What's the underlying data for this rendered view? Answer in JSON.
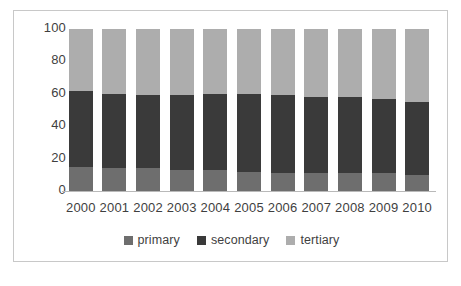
{
  "chart_data": {
    "type": "bar",
    "subtype": "stacked-100-percent",
    "title": "",
    "subtitle": "",
    "xlabel": "",
    "ylabel": "",
    "ylim": [
      0,
      100
    ],
    "yticks": [
      0,
      20,
      40,
      60,
      80,
      100
    ],
    "grid": false,
    "legend_position": "bottom",
    "categories": [
      "2000",
      "2001",
      "2002",
      "2003",
      "2004",
      "2005",
      "2006",
      "2007",
      "2008",
      "2009",
      "2010"
    ],
    "series": [
      {
        "name": "primary",
        "color": "#6e6e6e",
        "values": [
          15,
          14,
          14,
          13,
          13,
          12,
          11,
          11,
          11,
          11,
          10
        ]
      },
      {
        "name": "secondary",
        "color": "#3a3a3a",
        "values": [
          47,
          46,
          45,
          46,
          47,
          48,
          48,
          47,
          47,
          46,
          45
        ]
      },
      {
        "name": "tertiary",
        "color": "#adadad",
        "values": [
          38,
          40,
          41,
          41,
          40,
          40,
          41,
          42,
          42,
          43,
          45
        ]
      }
    ],
    "cumulative_tops": {
      "primary": [
        15,
        14,
        14,
        13,
        13,
        12,
        11,
        11,
        11,
        11,
        10
      ],
      "secondary": [
        62,
        60,
        59,
        59,
        60,
        60,
        59,
        58,
        58,
        57,
        55
      ],
      "tertiary": [
        100,
        100,
        100,
        100,
        100,
        100,
        100,
        100,
        100,
        100,
        100
      ]
    }
  },
  "axes": {
    "y_ticks": [
      "100",
      "80",
      "60",
      "40",
      "20",
      "0"
    ],
    "x_ticks": [
      "2000",
      "2001",
      "2002",
      "2003",
      "2004",
      "2005",
      "2006",
      "2007",
      "2008",
      "2009",
      "2010"
    ]
  },
  "legend": {
    "items": [
      {
        "label": "primary",
        "color": "#6e6e6e"
      },
      {
        "label": "secondary",
        "color": "#3a3a3a"
      },
      {
        "label": "tertiary",
        "color": "#adadad"
      }
    ]
  },
  "colors": {
    "frame_border": "#c8c8c8",
    "axis_line": "#b9b9b9",
    "text": "#3f3f3f",
    "background": "#ffffff"
  }
}
